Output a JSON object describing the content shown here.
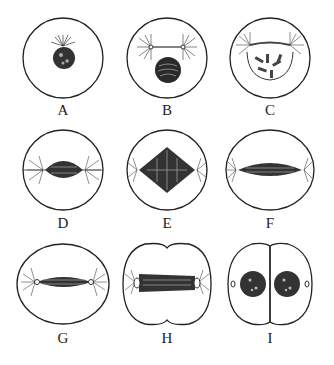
{
  "diagram": {
    "type": "mitosis-stages",
    "stages": [
      {
        "label": "A",
        "description": "interphase/early prophase: nucleus with centrosome"
      },
      {
        "label": "B",
        "description": "prophase: two asters, condensing chromatin"
      },
      {
        "label": "C",
        "description": "prometaphase: chromosomes visible, asters at poles"
      },
      {
        "label": "D",
        "description": "spindle forming"
      },
      {
        "label": "E",
        "description": "metaphase: diamond spindle"
      },
      {
        "label": "F",
        "description": "anaphase: elongated spindle"
      },
      {
        "label": "G",
        "description": "late anaphase: cell elongating"
      },
      {
        "label": "H",
        "description": "telophase: cleavage furrow"
      },
      {
        "label": "I",
        "description": "cytokinesis: two daughter cells"
      }
    ],
    "colors": {
      "line": "#222222",
      "background": "#ffffff"
    }
  }
}
